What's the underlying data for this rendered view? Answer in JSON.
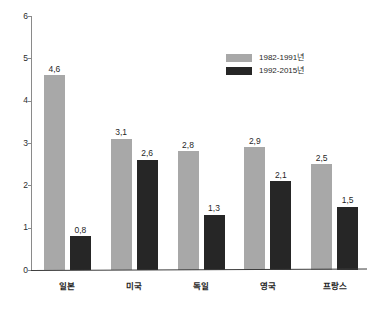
{
  "chart_data": {
    "type": "bar",
    "title": "",
    "subtitle": "",
    "xlabel": "",
    "ylabel": "",
    "ylim": [
      0,
      6
    ],
    "ytick_labels": [
      "0",
      "1",
      "2",
      "3",
      "4",
      "5",
      "6"
    ],
    "grid": false,
    "legend_position": "top-right",
    "decimal_separator": ",",
    "categories": [
      "일본",
      "미국",
      "독일",
      "영국",
      "프랑스"
    ],
    "series": [
      {
        "name": "1982-1991년",
        "color": "#a8a8a8",
        "values": [
          4.6,
          3.1,
          2.8,
          2.9,
          2.5
        ],
        "value_labels": [
          "4,6",
          "3,1",
          "2,8",
          "2,9",
          "2,5"
        ]
      },
      {
        "name": "1992-2015년",
        "color": "#262626",
        "values": [
          0.8,
          2.6,
          1.3,
          2.1,
          1.5
        ],
        "value_labels": [
          "0,8",
          "2,6",
          "1,3",
          "2,1",
          "1,5"
        ]
      }
    ]
  },
  "colors": {
    "series_a": "#a8a8a8",
    "series_b": "#262626",
    "axis": "#8a8a8a",
    "baseline": "#3d3d3d",
    "text": "#1f1f1f",
    "background": "#ffffff"
  }
}
